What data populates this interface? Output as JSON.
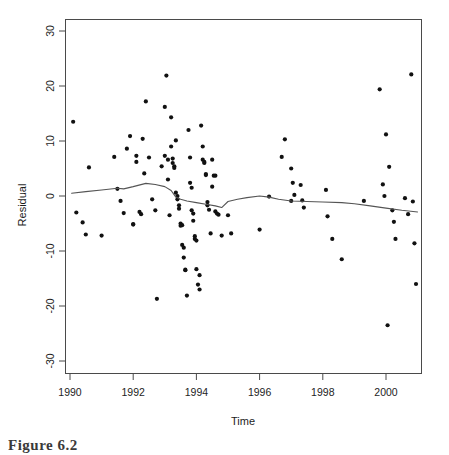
{
  "figure": {
    "caption": "Figure 6.2",
    "background_color": "#ffffff",
    "point_color": "#111111",
    "line_color": "#555555",
    "axis_color": "#4a4a4a"
  },
  "chart_data": {
    "type": "scatter",
    "title": "",
    "xlabel": "Time",
    "ylabel": "Residual",
    "xlim": [
      1989.6,
      2001.4
    ],
    "ylim": [
      -32.5,
      32.5
    ],
    "grid": false,
    "legend": null,
    "xticks": [
      1990,
      1992,
      1994,
      1996,
      1998,
      2000
    ],
    "xticklabels": [
      "1990",
      "1992",
      "1994",
      "1996",
      "1998",
      "2000"
    ],
    "yticks": [
      30,
      20,
      10,
      0,
      -10,
      -20,
      -30
    ],
    "yticklabels": [
      "30",
      "20",
      "10",
      "0",
      "-10",
      "-20",
      "-30"
    ],
    "series": [
      {
        "name": "residuals",
        "marker": "filled-circle",
        "points": [
          [
            1990.1,
            13.5
          ],
          [
            1990.2,
            -3.0
          ],
          [
            1990.4,
            -4.8
          ],
          [
            1990.5,
            -7.0
          ],
          [
            1990.6,
            5.2
          ],
          [
            1991.0,
            -7.2
          ],
          [
            1991.4,
            7.1
          ],
          [
            1991.5,
            1.3
          ],
          [
            1991.6,
            -0.9
          ],
          [
            1991.7,
            -3.1
          ],
          [
            1991.8,
            8.6
          ],
          [
            1991.9,
            10.9
          ],
          [
            1992.0,
            -5.1
          ],
          [
            1992.0,
            -5.2
          ],
          [
            1992.1,
            7.3
          ],
          [
            1992.1,
            6.2
          ],
          [
            1992.2,
            -2.9
          ],
          [
            1992.25,
            -3.3
          ],
          [
            1992.3,
            10.4
          ],
          [
            1992.35,
            4.1
          ],
          [
            1992.4,
            17.2
          ],
          [
            1992.5,
            7.0
          ],
          [
            1992.6,
            -0.6
          ],
          [
            1992.7,
            -2.6
          ],
          [
            1992.75,
            -18.7
          ],
          [
            1992.9,
            5.4
          ],
          [
            1993.0,
            7.3
          ],
          [
            1993.0,
            16.2
          ],
          [
            1993.05,
            21.9
          ],
          [
            1993.1,
            6.6
          ],
          [
            1993.1,
            3.0
          ],
          [
            1993.15,
            -3.5
          ],
          [
            1993.2,
            14.3
          ],
          [
            1993.2,
            9.0
          ],
          [
            1993.25,
            6.8
          ],
          [
            1993.25,
            6.0
          ],
          [
            1993.3,
            5.4
          ],
          [
            1993.3,
            5.1
          ],
          [
            1993.35,
            10.1
          ],
          [
            1993.35,
            0.6
          ],
          [
            1993.4,
            0.0
          ],
          [
            1993.4,
            -0.6
          ],
          [
            1993.45,
            -1.7
          ],
          [
            1993.45,
            -2.3
          ],
          [
            1993.5,
            -5.0
          ],
          [
            1993.5,
            -5.4
          ],
          [
            1993.55,
            -5.3
          ],
          [
            1993.55,
            -8.9
          ],
          [
            1993.6,
            -9.4
          ],
          [
            1993.6,
            -11.2
          ],
          [
            1993.65,
            -13.5
          ],
          [
            1993.65,
            -13.4
          ],
          [
            1993.7,
            -18.1
          ],
          [
            1993.75,
            12.0
          ],
          [
            1993.8,
            7.0
          ],
          [
            1993.8,
            2.4
          ],
          [
            1993.85,
            1.5
          ],
          [
            1993.85,
            -2.6
          ],
          [
            1993.9,
            -3.2
          ],
          [
            1993.9,
            -4.5
          ],
          [
            1993.95,
            -7.3
          ],
          [
            1993.95,
            -7.8
          ],
          [
            1994.0,
            -8.1
          ],
          [
            1994.0,
            -13.3
          ],
          [
            1994.05,
            -16.1
          ],
          [
            1994.1,
            -17.0
          ],
          [
            1994.1,
            -14.4
          ],
          [
            1994.15,
            12.8
          ],
          [
            1994.2,
            9.0
          ],
          [
            1994.2,
            6.6
          ],
          [
            1994.25,
            6.0
          ],
          [
            1994.25,
            6.2
          ],
          [
            1994.3,
            4.0
          ],
          [
            1994.3,
            3.8
          ],
          [
            1994.35,
            -1.1
          ],
          [
            1994.35,
            -1.7
          ],
          [
            1994.4,
            -2.5
          ],
          [
            1994.45,
            -6.8
          ],
          [
            1994.5,
            6.6
          ],
          [
            1994.5,
            1.7
          ],
          [
            1994.55,
            3.7
          ],
          [
            1994.6,
            3.7
          ],
          [
            1994.6,
            -2.8
          ],
          [
            1994.65,
            -3.2
          ],
          [
            1994.7,
            -3.4
          ],
          [
            1994.8,
            -7.2
          ],
          [
            1995.0,
            -3.5
          ],
          [
            1995.1,
            -6.8
          ],
          [
            1996.0,
            -6.1
          ],
          [
            1996.7,
            7.1
          ],
          [
            1996.8,
            10.3
          ],
          [
            1997.0,
            5.0
          ],
          [
            1997.05,
            2.4
          ],
          [
            1997.1,
            0.2
          ],
          [
            1997.3,
            2.0
          ],
          [
            1997.35,
            -0.8
          ],
          [
            1997.4,
            -2.1
          ],
          [
            1998.1,
            1.1
          ],
          [
            1998.15,
            -3.7
          ],
          [
            1998.3,
            -7.8
          ],
          [
            1998.6,
            -11.5
          ],
          [
            1999.8,
            19.4
          ],
          [
            1999.9,
            2.1
          ],
          [
            1999.95,
            0.0
          ],
          [
            2000.0,
            11.2
          ],
          [
            2000.05,
            -23.5
          ],
          [
            2000.1,
            5.3
          ],
          [
            2000.2,
            -2.6
          ],
          [
            2000.25,
            -4.7
          ],
          [
            2000.3,
            -7.8
          ],
          [
            2000.6,
            -0.4
          ],
          [
            2000.7,
            -3.3
          ],
          [
            2000.8,
            22.1
          ],
          [
            2000.85,
            -1.0
          ],
          [
            2000.9,
            -8.6
          ],
          [
            2000.95,
            -16.0
          ],
          [
            1996.3,
            -0.1
          ],
          [
            1997.0,
            -0.9
          ],
          [
            1999.3,
            -0.9
          ]
        ]
      }
    ],
    "smoother": {
      "name": "lowess-smooth",
      "style": "solid-line",
      "points": [
        [
          1990.05,
          0.5
        ],
        [
          1990.5,
          0.8
        ],
        [
          1991.0,
          1.1
        ],
        [
          1991.5,
          1.4
        ],
        [
          1991.7,
          1.3
        ],
        [
          1992.0,
          1.7
        ],
        [
          1992.4,
          2.3
        ],
        [
          1992.7,
          2.1
        ],
        [
          1993.0,
          1.7
        ],
        [
          1993.2,
          1.0
        ],
        [
          1993.35,
          -0.2
        ],
        [
          1993.5,
          -0.6
        ],
        [
          1993.7,
          -0.9
        ],
        [
          1994.0,
          -1.2
        ],
        [
          1994.3,
          -1.5
        ],
        [
          1994.6,
          -1.8
        ],
        [
          1994.8,
          -2.1
        ],
        [
          1995.0,
          -1.0
        ],
        [
          1995.3,
          -0.6
        ],
        [
          1995.6,
          -0.3
        ],
        [
          1996.0,
          0.0
        ],
        [
          1996.3,
          -0.2
        ],
        [
          1996.6,
          -0.6
        ],
        [
          1997.0,
          -0.9
        ],
        [
          1997.5,
          -1.0
        ],
        [
          1998.0,
          -1.1
        ],
        [
          1998.6,
          -1.2
        ],
        [
          1999.0,
          -1.4
        ],
        [
          1999.5,
          -1.8
        ],
        [
          2000.0,
          -2.2
        ],
        [
          2000.5,
          -2.6
        ],
        [
          2001.0,
          -2.9
        ]
      ]
    }
  }
}
